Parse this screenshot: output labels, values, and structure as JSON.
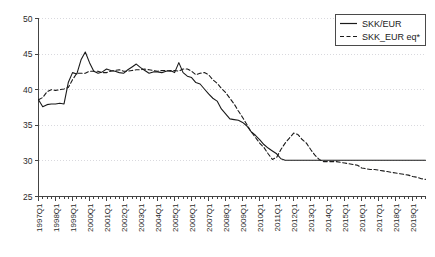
{
  "chart_data": {
    "type": "line",
    "title": "",
    "subtitle": "",
    "xlabel": "",
    "ylabel": "",
    "xlim": [
      "1997Q1",
      "2019Q4"
    ],
    "ylim": [
      25,
      50
    ],
    "yticks": [
      25,
      30,
      35,
      40,
      45,
      50
    ],
    "grid": true,
    "grid_style": "dotted",
    "grid_color": "#d9d9de",
    "legend_position": "top-right",
    "x_tick_labels": [
      "1997Q1",
      "1998Q1",
      "1999Q1",
      "2000Q1",
      "2001Q1",
      "2002Q1",
      "2003Q1",
      "2004Q1",
      "2005Q1",
      "2006Q1",
      "2007Q1",
      "2008Q1",
      "2009Q1",
      "2010Q1",
      "2011Q1",
      "2012Q1",
      "2013Q1",
      "2014Q1",
      "2015Q1",
      "2016Q1",
      "2017Q1",
      "2018Q1",
      "2019Q1"
    ],
    "x": [
      "1997Q1",
      "1997Q2",
      "1997Q3",
      "1997Q4",
      "1998Q1",
      "1998Q2",
      "1998Q3",
      "1998Q4",
      "1999Q1",
      "1999Q2",
      "1999Q3",
      "1999Q4",
      "2000Q1",
      "2000Q2",
      "2000Q3",
      "2000Q4",
      "2001Q1",
      "2001Q2",
      "2001Q3",
      "2001Q4",
      "2002Q1",
      "2002Q2",
      "2002Q3",
      "2002Q4",
      "2003Q1",
      "2003Q2",
      "2003Q3",
      "2003Q4",
      "2004Q1",
      "2004Q2",
      "2004Q3",
      "2004Q4",
      "2005Q1",
      "2005Q2",
      "2005Q3",
      "2005Q4",
      "2006Q1",
      "2006Q2",
      "2006Q3",
      "2006Q4",
      "2007Q1",
      "2007Q2",
      "2007Q3",
      "2007Q4",
      "2008Q1",
      "2008Q2",
      "2008Q3",
      "2008Q4",
      "2009Q1",
      "2009Q2",
      "2009Q3",
      "2009Q4",
      "2010Q1",
      "2010Q2",
      "2010Q3",
      "2010Q4",
      "2011Q1",
      "2011Q2",
      "2011Q3",
      "2011Q4",
      "2012Q1",
      "2012Q2",
      "2012Q3",
      "2012Q4",
      "2013Q1",
      "2013Q2",
      "2013Q3",
      "2013Q4",
      "2014Q1",
      "2014Q2",
      "2014Q3",
      "2014Q4",
      "2015Q1",
      "2015Q2",
      "2015Q3",
      "2015Q4",
      "2016Q1",
      "2016Q2",
      "2016Q3",
      "2016Q4",
      "2017Q1",
      "2017Q2",
      "2017Q3",
      "2017Q4",
      "2018Q1",
      "2018Q2",
      "2018Q3",
      "2018Q4",
      "2019Q1",
      "2019Q2",
      "2019Q3",
      "2019Q4"
    ],
    "series": [
      {
        "name": "SKK/EUR",
        "style": "solid",
        "color": "#1a1a1a",
        "values": [
          38.6,
          37.6,
          37.9,
          38.0,
          38.0,
          38.1,
          38.0,
          41.0,
          42.4,
          42.2,
          44.2,
          45.3,
          43.8,
          42.6,
          42.3,
          42.5,
          42.9,
          42.7,
          42.6,
          42.4,
          42.3,
          42.8,
          43.2,
          43.6,
          43.1,
          42.7,
          42.3,
          42.5,
          42.5,
          42.4,
          42.6,
          42.7,
          42.4,
          43.8,
          42.4,
          41.9,
          41.7,
          41.0,
          40.8,
          40.1,
          39.4,
          38.8,
          38.4,
          37.3,
          36.6,
          35.9,
          35.8,
          35.7,
          35.4,
          34.9,
          34.1,
          33.6,
          33.0,
          32.3,
          31.8,
          31.4,
          31.0,
          30.3,
          30.1,
          30.1,
          30.1,
          30.1,
          30.1,
          30.1,
          30.1,
          30.1,
          30.1,
          30.1,
          30.1,
          30.1,
          30.1,
          30.1,
          30.1,
          30.1,
          30.1,
          30.1,
          30.1,
          30.1,
          30.1,
          30.1,
          30.1,
          30.1,
          30.1,
          30.1,
          30.1,
          30.1,
          30.1,
          30.1,
          30.1,
          30.1,
          30.1,
          30.1
        ]
      },
      {
        "name": "SKK_EUR eq*",
        "style": "dashed",
        "color": "#1a1a1a",
        "values": [
          38.6,
          38.9,
          39.7,
          40.0,
          39.9,
          40.0,
          40.1,
          40.3,
          41.4,
          42.3,
          42.3,
          42.3,
          42.6,
          42.6,
          42.6,
          42.4,
          42.4,
          42.6,
          42.7,
          42.8,
          42.6,
          42.6,
          42.7,
          42.8,
          42.8,
          42.9,
          42.8,
          42.7,
          42.6,
          42.7,
          42.7,
          42.6,
          42.7,
          42.6,
          42.9,
          42.9,
          42.6,
          42.1,
          42.3,
          42.4,
          42.1,
          41.4,
          40.9,
          40.2,
          39.6,
          38.8,
          38.0,
          37.0,
          36.1,
          35.1,
          34.1,
          33.3,
          32.5,
          31.9,
          31.0,
          30.2,
          30.5,
          31.6,
          32.5,
          33.2,
          33.9,
          33.7,
          33.0,
          32.5,
          31.6,
          30.8,
          30.2,
          29.9,
          29.9,
          29.9,
          29.9,
          29.8,
          29.7,
          29.6,
          29.5,
          29.4,
          29.0,
          28.9,
          28.8,
          28.8,
          28.7,
          28.6,
          28.5,
          28.4,
          28.3,
          28.2,
          28.1,
          28.0,
          27.8,
          27.7,
          27.5,
          27.4
        ]
      }
    ]
  },
  "legend": {
    "entries": [
      {
        "label": "SKK/EUR",
        "style": "solid"
      },
      {
        "label": "SKK_EUR eq*",
        "style": "dashed"
      }
    ]
  }
}
